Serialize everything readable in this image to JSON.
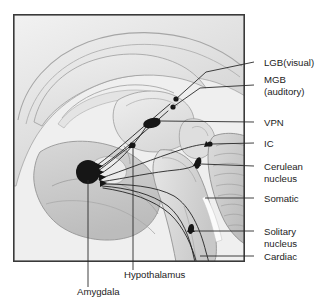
{
  "figure": {
    "title_visible": false,
    "background_color": "#ffffff",
    "frame_color": "#3a3a3a",
    "illustration_description": "Midsagittal grayscale illustration of the human brain showing cortex, corpus callosum, thalamus, brainstem and cerebellum, with sensory pathways converging on the amygdala",
    "frame": {
      "x": 13,
      "y": 14,
      "width": 232,
      "height": 248
    }
  },
  "right_labels": [
    {
      "id": "lgb-visual",
      "text": "LGB(visual)",
      "lines": [
        "LGB(visual)"
      ],
      "y": 62,
      "dash_x1": 254,
      "dash_x2": 261,
      "text_x": 264
    },
    {
      "id": "mgb-auditory",
      "text": "MGB (auditory)",
      "lines": [
        "MGB",
        "(auditory)"
      ],
      "y": 85,
      "dash_x1": 254,
      "dash_x2": 261,
      "text_x": 264
    },
    {
      "id": "vpn",
      "text": "VPN",
      "lines": [
        "VPN"
      ],
      "y": 122,
      "dash_x1": 254,
      "dash_x2": 261,
      "text_x": 264
    },
    {
      "id": "ic",
      "text": "IC",
      "lines": [
        "IC"
      ],
      "y": 143,
      "dash_x1": 254,
      "dash_x2": 261,
      "text_x": 264
    },
    {
      "id": "cerulean-nucleus",
      "text": "Cerulean nucleus",
      "lines": [
        "Cerulean",
        "nucleus"
      ],
      "y": 166,
      "dash_x1": 254,
      "dash_x2": 261,
      "text_x": 264
    },
    {
      "id": "somatic",
      "text": "Somatic",
      "lines": [
        "Somatic"
      ],
      "y": 198,
      "dash_x1": 254,
      "dash_x2": 261,
      "text_x": 264
    },
    {
      "id": "solitary-nucleus",
      "text": "Solitary nucleus",
      "lines": [
        "Solitary",
        "nucleus"
      ],
      "y": 231,
      "dash_x1": 254,
      "dash_x2": 261,
      "text_x": 264
    },
    {
      "id": "cardiac",
      "text": "Cardiac",
      "lines": [
        "Cardiac"
      ],
      "y": 256,
      "dash_x1": 254,
      "dash_x2": 261,
      "text_x": 264
    }
  ],
  "bottom_labels": [
    {
      "id": "hypothalamus",
      "text": "Hypothalamus",
      "text_x": 124,
      "text_y": 278,
      "leader_x": 133,
      "leader_y1": 148,
      "leader_y2": 270
    },
    {
      "id": "amygdala",
      "text": "Amygdala",
      "text_x": 77,
      "text_y": 295,
      "leader_x": 88,
      "leader_y1": 180,
      "leader_y2": 287
    }
  ],
  "structures": [
    {
      "id": "amygdala-body",
      "type": "filled-circle",
      "cx": 88,
      "cy": 172,
      "r": 12
    },
    {
      "id": "vpn-body",
      "type": "filled-oval",
      "cx": 152,
      "cy": 123,
      "rx": 9,
      "ry": 5
    },
    {
      "id": "lgb-body",
      "type": "filled-dot",
      "cx": 176,
      "cy": 99,
      "r": 2.6
    },
    {
      "id": "mgb-body",
      "type": "filled-dot",
      "cx": 173,
      "cy": 107,
      "r": 2.6
    },
    {
      "id": "ic-body",
      "type": "filled-dot",
      "cx": 210,
      "cy": 144,
      "r": 2.6
    },
    {
      "id": "cerulean-body",
      "type": "filled-oval",
      "cx": 198,
      "cy": 163,
      "rx": 3,
      "ry": 6
    },
    {
      "id": "solitary-body",
      "type": "filled-oval",
      "cx": 191,
      "cy": 229,
      "rx": 3,
      "ry": 5
    },
    {
      "id": "hypothalamus-marker",
      "type": "filled-dot",
      "cx": 133,
      "cy": 145,
      "r": 2.6
    }
  ],
  "palette": {
    "page_background": "#ffffff",
    "frame_stroke": "#3a3a3a",
    "text": "#1c1c1c",
    "pathway_stroke": "#1a1a1a",
    "nucleus_fill": "#161616",
    "brain_light": "#e8e8e8",
    "brain_mid": "#d2d2d2",
    "brain_dark": "#b4b4b4",
    "brain_outline": "#8a8a8a"
  }
}
